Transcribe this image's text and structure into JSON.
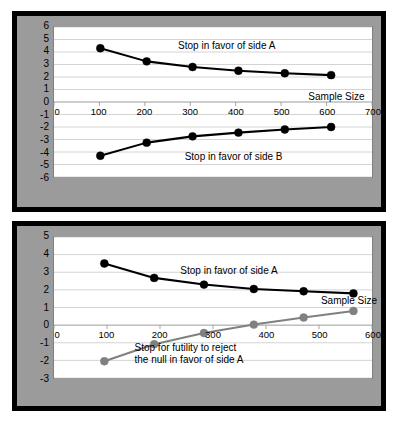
{
  "figure": {
    "panels": [
      {
        "id": "top",
        "chart_data": {
          "type": "line",
          "title": "",
          "xlabel": "Sample Size",
          "ylabel": "",
          "xlim": [
            0,
            700
          ],
          "ylim": [
            -6,
            6
          ],
          "xticks": [
            0,
            100,
            200,
            300,
            400,
            500,
            600,
            700
          ],
          "xticklabels": [
            "0",
            "100",
            "200",
            "300",
            "400",
            "500",
            "600",
            "700"
          ],
          "yticks": [
            6,
            5,
            4,
            3,
            2,
            1,
            0,
            -1,
            -2,
            -3,
            -4,
            -5,
            -6
          ],
          "yticklabels": [
            "6",
            "5",
            "4",
            "3",
            "2",
            "1",
            "0",
            "-1",
            "-2",
            "-3",
            "-4",
            "-5",
            "-6"
          ],
          "grid": true,
          "legend": "annotations",
          "series": [
            {
              "name": "Stop in favor of side A",
              "color": "#000000",
              "x": [
                102,
                204,
                305,
                406,
                508,
                610
              ],
              "y": [
                4.3,
                3.25,
                2.8,
                2.5,
                2.3,
                2.15
              ]
            },
            {
              "name": "Stop in favor of side B",
              "color": "#000000",
              "x": [
                102,
                204,
                305,
                406,
                508,
                610
              ],
              "y": [
                -4.3,
                -3.25,
                -2.75,
                -2.45,
                -2.2,
                -2.0
              ]
            }
          ],
          "annotations": [
            {
              "text": "Stop in favor of side A",
              "x": 380,
              "y": 4.45
            },
            {
              "text": "Stop in favor of side B",
              "x": 395,
              "y": -4.35
            },
            {
              "text": "Sample Size",
              "x": 620,
              "y": 0.45
            }
          ]
        }
      },
      {
        "id": "bottom",
        "chart_data": {
          "type": "line",
          "title": "",
          "xlabel": "Sample Size",
          "ylabel": "",
          "xlim": [
            0,
            600
          ],
          "ylim": [
            -3,
            5
          ],
          "xticks": [
            0,
            100,
            200,
            300,
            400,
            500,
            600
          ],
          "xticklabels": [
            "0",
            "100",
            "200",
            "300",
            "400",
            "500",
            "600"
          ],
          "yticks": [
            5,
            4,
            3,
            2,
            1,
            0,
            -1,
            -2,
            -3
          ],
          "yticklabels": [
            "5",
            "4",
            "3",
            "2",
            "1",
            "0",
            "-1",
            "-2",
            "-3"
          ],
          "grid": true,
          "legend": "annotations",
          "series": [
            {
              "name": "Stop in favor of side A",
              "color": "#000000",
              "x": [
                95,
                189,
                283,
                377,
                471,
                565
              ],
              "y": [
                3.5,
                2.68,
                2.3,
                2.05,
                1.92,
                1.8
              ]
            },
            {
              "name": "Stop for futility to reject the null in favor of side A",
              "color": "#808080",
              "x": [
                95,
                189,
                283,
                377,
                471,
                565
              ],
              "y": [
                -2.05,
                -1.08,
                -0.45,
                0.03,
                0.43,
                0.8
              ]
            }
          ],
          "annotations": [
            {
              "text": "Stop in favor of side A",
              "x": 330,
              "y": 3.05
            },
            {
              "text": "Stop for futility to reject\nthe null in favor of side A",
              "x": 255,
              "y": -1.55
            },
            {
              "text": "Sample Size",
              "x": 555,
              "y": 1.42
            }
          ]
        }
      }
    ]
  },
  "style": {
    "panel_background": "#9b9b9b",
    "panel_border": "#000000",
    "plot_background": "#ffffff",
    "grid_color": "#c8c8c8",
    "axis_color": "#808080",
    "series_black": "#000000",
    "series_gray": "#808080"
  }
}
